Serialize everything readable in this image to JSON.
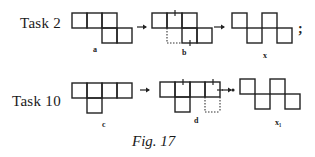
{
  "figure": {
    "caption": "Fig. 17",
    "rows": [
      {
        "task_label": "Task 2",
        "shapes": [
          {
            "id": "a",
            "label": "a",
            "description": "five squares: three in a top row, two in a lower row offset right"
          },
          {
            "id": "b",
            "label": "b",
            "description": "shape a with moved matchsticks marked by ticks and dotted lines"
          },
          {
            "id": "x",
            "label": "x",
            "description": "four squares in a zig-zag staircase"
          }
        ],
        "terminator": ";"
      },
      {
        "task_label": "Task 10",
        "shapes": [
          {
            "id": "c",
            "label": "c",
            "description": "four squares in a row with one square below the second"
          },
          {
            "id": "d",
            "label": "d",
            "description": "shape c with marked matchsticks and a dotted square"
          },
          {
            "id": "x1",
            "label": "x₁",
            "description": "four squares in a zig-zag staircase"
          }
        ]
      }
    ],
    "arrow_glyph": "→"
  }
}
